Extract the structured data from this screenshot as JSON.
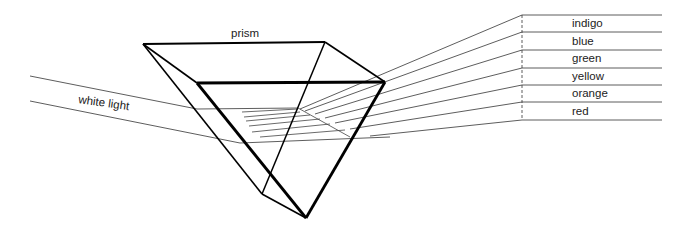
{
  "title": "prism",
  "input_label": "white light",
  "colors": [
    "indigo",
    "blue",
    "green",
    "yellow",
    "orange",
    "red"
  ],
  "stroke_color": "#000000"
}
